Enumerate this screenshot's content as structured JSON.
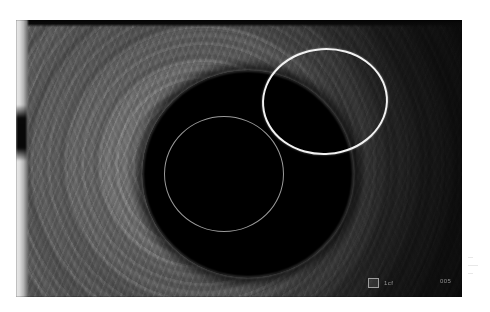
{
  "figure": {
    "modality": "endoscopic-ultrasound",
    "frame": {
      "left": 16,
      "top": 20,
      "width": 446,
      "height": 277,
      "background_color": "#151515"
    }
  },
  "annotations": {
    "roi": {
      "shape": "ellipse",
      "label": "region-of-interest",
      "stroke_color": "#f2f2f2",
      "stroke_width": "2.6px",
      "left": 246,
      "top": 28,
      "width": 126,
      "height": 107,
      "rotation_deg": -4
    }
  },
  "anatomy": {
    "lumen": {
      "label": "anechoic lumen",
      "fill_color": "#000000",
      "outer_rim_color": "#c4c4c4",
      "inner_ring_color": "#d6d6d6"
    },
    "wall": {
      "label": "layered wall speckle",
      "base_color": "#7a7a7a"
    },
    "shadow": {
      "label": "acoustic shadow",
      "color": "#1d1d1d"
    },
    "transducer_band": {
      "label": "near-field transducer band",
      "color": "#e9e9e9"
    }
  },
  "overlay": {
    "marker_glyph": "■",
    "scale_text": "1cf",
    "depth_text": "005"
  },
  "caption_fragment": {
    "lines": [
      "—",
      "——",
      "—"
    ]
  }
}
